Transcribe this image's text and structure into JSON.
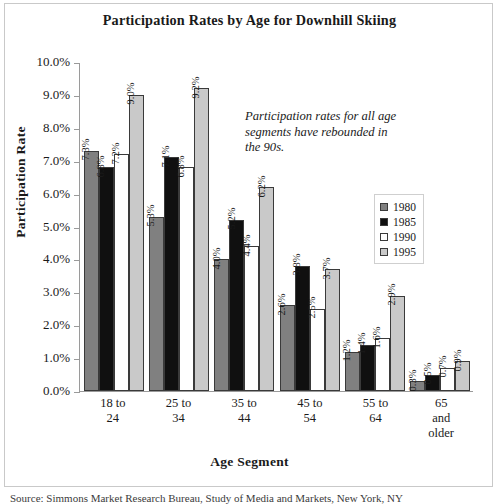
{
  "chart_data": {
    "type": "bar",
    "title": "Participation Rates by Age for Downhill Skiing",
    "xlabel": "Age Segment",
    "ylabel": "Participation Rate",
    "ylim": [
      0,
      10
    ],
    "ytick_labels": [
      "10.0%",
      "9.0%",
      "8.0%",
      "7.0%",
      "6.0%",
      "5.0%",
      "4.0%",
      "3.0%",
      "2.0%",
      "1.0%",
      "0.0%"
    ],
    "ytick_values": [
      10,
      9,
      8,
      7,
      6,
      5,
      4,
      3,
      2,
      1,
      0
    ],
    "grid": false,
    "legend_position": "right",
    "categories": [
      "18 to 24",
      "25 to 34",
      "35 to 44",
      "45 to 54",
      "55 to 64",
      "65 and older"
    ],
    "category_lines": [
      [
        "18 to",
        "24"
      ],
      [
        "25 to",
        "34"
      ],
      [
        "35 to",
        "44"
      ],
      [
        "45 to",
        "54"
      ],
      [
        "55 to",
        "64"
      ],
      [
        "65",
        "and",
        "older"
      ]
    ],
    "series": [
      {
        "name": "1980",
        "color": "#808080",
        "values": [
          7.3,
          5.3,
          4.0,
          2.6,
          1.2,
          0.3
        ],
        "labels": [
          "7.3%",
          "5.3%",
          "4.0%",
          "2.6%",
          "1.2%",
          "0.3%"
        ]
      },
      {
        "name": "1985",
        "color": "#101010",
        "values": [
          6.8,
          7.1,
          5.2,
          3.8,
          1.4,
          0.5
        ],
        "labels": [
          "6.8%",
          "7.1%",
          "5.2%",
          "3.8%",
          "1.4%",
          "0.5%"
        ]
      },
      {
        "name": "1990",
        "color": "#ffffff",
        "values": [
          7.2,
          6.8,
          4.4,
          2.5,
          1.6,
          0.7
        ],
        "labels": [
          "7.2%",
          "6.8%",
          "4.4%",
          "2.5%",
          "1.6%",
          "0.7%"
        ]
      },
      {
        "name": "1995",
        "color": "#c9c9c9",
        "values": [
          9.0,
          9.2,
          6.2,
          3.7,
          2.9,
          0.9
        ],
        "labels": [
          "9.0%",
          "9.2%",
          "6.2%",
          "3.7%",
          "2.9%",
          "0.9%"
        ]
      }
    ],
    "annotation": "Participation rates for all age segments have rebounded in the 90s."
  },
  "source_note": "Source: Simmons Market Research Bureau, Study of Media and Markets, New York, NY"
}
